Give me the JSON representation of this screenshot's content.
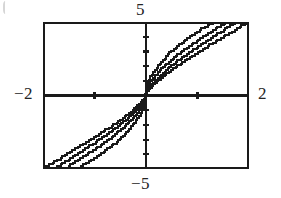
{
  "figure": {
    "title": "",
    "background_color": "#ffffff",
    "ink_color": "#1a1a1a",
    "frame_color": "#1a1a1a",
    "scan_artifact": ""
  },
  "labels": {
    "y_max": "5",
    "y_min": "−5",
    "x_min": "−2",
    "x_max": "2"
  },
  "chart_data": {
    "type": "line",
    "title": "",
    "subtitle": "",
    "xlabel": "",
    "ylabel": "",
    "xlim": [
      -2,
      2
    ],
    "ylim": [
      -5,
      5
    ],
    "xticks": [
      -2,
      -1,
      0,
      1,
      2
    ],
    "yticks": [
      -5,
      -4,
      -3,
      -2,
      -1,
      0,
      1,
      2,
      3,
      4,
      5
    ],
    "xtick_labels": [
      "−2",
      "",
      "",
      "",
      "2"
    ],
    "ytick_labels": [
      "−5",
      "",
      "",
      "",
      "",
      "",
      "",
      "",
      "",
      "",
      "5"
    ],
    "grid": false,
    "legend": false,
    "legend_position": "none",
    "axes_style": "calculator-window-with-centered-axes",
    "annotations": [],
    "series": [
      {
        "name": "curve-1",
        "exponent": 0.3333333333,
        "points": [
          [
            -2.0,
            -6.3
          ],
          [
            -1.8,
            -5.94
          ],
          [
            -1.6,
            -5.56
          ],
          [
            -1.4,
            -5.16
          ],
          [
            -1.2,
            -4.73
          ],
          [
            -1.0,
            -4.3
          ],
          [
            -0.85,
            -3.95
          ],
          [
            -0.7,
            -3.56
          ],
          [
            -0.55,
            -3.13
          ],
          [
            -0.4,
            -2.63
          ],
          [
            -0.3,
            -2.25
          ],
          [
            -0.2,
            -1.8
          ],
          [
            -0.12,
            -1.38
          ],
          [
            -0.06,
            -1.04
          ],
          [
            -0.02,
            -0.67
          ],
          [
            0,
            0
          ],
          [
            0.02,
            0.67
          ],
          [
            0.06,
            1.04
          ],
          [
            0.12,
            1.38
          ],
          [
            0.2,
            1.8
          ],
          [
            0.3,
            2.25
          ],
          [
            0.4,
            2.63
          ],
          [
            0.55,
            3.13
          ],
          [
            0.7,
            3.56
          ],
          [
            0.85,
            3.95
          ],
          [
            1.0,
            4.3
          ],
          [
            1.2,
            4.73
          ],
          [
            1.4,
            5.16
          ],
          [
            1.6,
            5.56
          ],
          [
            1.8,
            5.94
          ],
          [
            2.0,
            6.3
          ]
        ]
      },
      {
        "name": "curve-2",
        "exponent": 0.5,
        "points": [
          [
            -2.0,
            -5.94
          ],
          [
            -1.8,
            -5.5
          ],
          [
            -1.6,
            -5.06
          ],
          [
            -1.4,
            -4.61
          ],
          [
            -1.2,
            -4.16
          ],
          [
            -1.0,
            -3.7
          ],
          [
            -0.85,
            -3.34
          ],
          [
            -0.7,
            -2.96
          ],
          [
            -0.55,
            -2.54
          ],
          [
            -0.4,
            -2.09
          ],
          [
            -0.3,
            -1.76
          ],
          [
            -0.2,
            -1.38
          ],
          [
            -0.12,
            -1.03
          ],
          [
            -0.06,
            -0.75
          ],
          [
            -0.02,
            -0.45
          ],
          [
            0,
            0
          ],
          [
            0.02,
            0.45
          ],
          [
            0.06,
            0.75
          ],
          [
            0.12,
            1.03
          ],
          [
            0.2,
            1.38
          ],
          [
            0.3,
            1.76
          ],
          [
            0.4,
            2.09
          ],
          [
            0.55,
            2.54
          ],
          [
            0.7,
            2.96
          ],
          [
            0.85,
            3.34
          ],
          [
            1.0,
            3.7
          ],
          [
            1.2,
            4.16
          ],
          [
            1.4,
            4.61
          ],
          [
            1.6,
            5.06
          ],
          [
            1.8,
            5.5
          ],
          [
            2.0,
            5.94
          ]
        ]
      },
      {
        "name": "curve-3",
        "exponent": 0.7,
        "points": [
          [
            -2.0,
            -5.49
          ],
          [
            -1.8,
            -5.06
          ],
          [
            -1.6,
            -4.62
          ],
          [
            -1.4,
            -4.17
          ],
          [
            -1.2,
            -3.72
          ],
          [
            -1.0,
            -3.25
          ],
          [
            -0.85,
            -2.9
          ],
          [
            -0.7,
            -2.53
          ],
          [
            -0.55,
            -2.13
          ],
          [
            -0.4,
            -1.7
          ],
          [
            -0.3,
            -1.39
          ],
          [
            -0.2,
            -1.05
          ],
          [
            -0.12,
            -0.74
          ],
          [
            -0.06,
            -0.51
          ],
          [
            -0.02,
            -0.27
          ],
          [
            0,
            0
          ],
          [
            0.02,
            0.27
          ],
          [
            0.06,
            0.51
          ],
          [
            0.12,
            0.74
          ],
          [
            0.2,
            1.05
          ],
          [
            0.3,
            1.39
          ],
          [
            0.4,
            1.7
          ],
          [
            0.55,
            2.13
          ],
          [
            0.7,
            2.53
          ],
          [
            0.85,
            2.9
          ],
          [
            1.0,
            3.25
          ],
          [
            1.2,
            3.72
          ],
          [
            1.4,
            4.17
          ],
          [
            1.6,
            4.62
          ],
          [
            1.8,
            5.06
          ],
          [
            2.0,
            5.49
          ]
        ]
      },
      {
        "name": "curve-4",
        "exponent": 1.0,
        "points": [
          [
            -2.0,
            -5.0
          ],
          [
            -1.8,
            -4.58
          ],
          [
            -1.6,
            -4.16
          ],
          [
            -1.4,
            -3.73
          ],
          [
            -1.2,
            -3.3
          ],
          [
            -1.0,
            -2.87
          ],
          [
            -0.85,
            -2.54
          ],
          [
            -0.7,
            -2.2
          ],
          [
            -0.55,
            -1.84
          ],
          [
            -0.4,
            -1.45
          ],
          [
            -0.3,
            -1.17
          ],
          [
            -0.2,
            -0.86
          ],
          [
            -0.12,
            -0.59
          ],
          [
            -0.06,
            -0.39
          ],
          [
            -0.02,
            -0.19
          ],
          [
            0,
            0
          ],
          [
            0.02,
            0.19
          ],
          [
            0.06,
            0.39
          ],
          [
            0.12,
            0.59
          ],
          [
            0.2,
            0.86
          ],
          [
            0.3,
            1.17
          ],
          [
            0.4,
            1.45
          ],
          [
            0.55,
            1.84
          ],
          [
            0.7,
            2.2
          ],
          [
            0.85,
            2.54
          ],
          [
            1.0,
            2.87
          ],
          [
            1.2,
            3.3
          ],
          [
            1.4,
            3.73
          ],
          [
            1.6,
            4.16
          ],
          [
            1.8,
            4.58
          ],
          [
            2.0,
            5.0
          ]
        ]
      }
    ]
  }
}
